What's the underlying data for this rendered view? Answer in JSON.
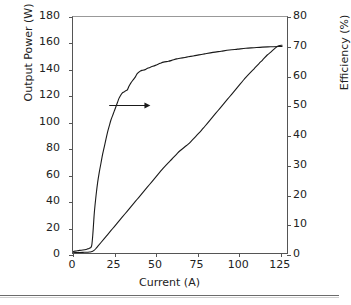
{
  "chart_data": {
    "type": "line",
    "title": "",
    "xlabel": "Current (A)",
    "ylabel": "Output Power (W)",
    "y2label": "Efficiency (%)",
    "xlim": [
      0,
      130
    ],
    "ylim": [
      0,
      180
    ],
    "y2lim": [
      0,
      80
    ],
    "grid": false,
    "legend": "none",
    "xticks": [
      "0",
      "25",
      "50",
      "75",
      "100",
      "125"
    ],
    "xtick_values": [
      0,
      25,
      50,
      75,
      100,
      125
    ],
    "yticks": [
      "0",
      "20",
      "40",
      "60",
      "80",
      "100",
      "120",
      "140",
      "160",
      "180"
    ],
    "ytick_values": [
      0,
      20,
      40,
      60,
      80,
      100,
      120,
      140,
      160,
      180
    ],
    "y2ticks": [
      "0",
      "10",
      "20",
      "30",
      "40",
      "50",
      "60",
      "70",
      "80"
    ],
    "y2tick_values": [
      0,
      10,
      20,
      30,
      40,
      50,
      60,
      70,
      80
    ],
    "annotations": [
      {
        "name": "arrow-to-right-axis",
        "type": "arrow",
        "direction": "right",
        "x_start": 22,
        "x_end": 47,
        "y_axis": "right",
        "y_value": 50
      }
    ],
    "series": [
      {
        "name": "Output Power",
        "axis": "left",
        "units": "W",
        "color": "#1a1a1a",
        "x": [
          0,
          2,
          4,
          6,
          8,
          10,
          11,
          12,
          13,
          14,
          15,
          17,
          20,
          23,
          25,
          28,
          30,
          33,
          35,
          38,
          40,
          43,
          45,
          48,
          50,
          53,
          55,
          58,
          60,
          63,
          65,
          68,
          70,
          72,
          75,
          78,
          80,
          83,
          85,
          88,
          90,
          93,
          95,
          98,
          100,
          103,
          105,
          108,
          110,
          113,
          115,
          118,
          120,
          123,
          125,
          127
        ],
        "y": [
          0.2,
          0.3,
          0.4,
          0.5,
          0.6,
          0.8,
          1.0,
          1.4,
          2.2,
          3.5,
          5.0,
          8.0,
          12.5,
          17.0,
          20.0,
          24.5,
          27.5,
          32.0,
          35.0,
          39.5,
          42.5,
          47.0,
          50.0,
          54.5,
          57.5,
          62.0,
          65.0,
          69.0,
          71.5,
          75.5,
          78.0,
          81.0,
          83.0,
          85.5,
          89.5,
          93.5,
          96.5,
          101.0,
          104.0,
          108.5,
          111.5,
          116.0,
          119.0,
          123.5,
          126.5,
          131.0,
          134.0,
          138.0,
          140.5,
          144.5,
          147.0,
          151.0,
          153.0,
          156.5,
          158.0,
          158.5
        ]
      },
      {
        "name": "Efficiency",
        "axis": "right",
        "units": "%",
        "color": "#1a1a1a",
        "x": [
          0,
          2,
          4,
          6,
          8,
          9,
          10,
          11,
          11.5,
          12,
          12.5,
          13,
          14,
          15,
          16,
          17,
          18,
          19,
          20,
          21,
          22,
          23,
          24,
          25,
          26,
          27,
          28,
          29,
          30,
          31,
          32,
          33,
          34,
          35,
          36,
          37,
          38,
          39,
          40,
          41,
          42,
          43,
          45,
          47,
          50,
          53,
          55,
          58,
          60,
          63,
          65,
          68,
          70,
          73,
          75,
          78,
          80,
          85,
          90,
          95,
          100,
          105,
          110,
          115,
          120,
          125,
          127
        ],
        "y": [
          0.5,
          0.7,
          0.9,
          1.0,
          1.2,
          1.4,
          1.6,
          2.0,
          3.0,
          6.0,
          10.0,
          14.0,
          19.5,
          24.0,
          27.5,
          30.5,
          33.5,
          36.0,
          38.5,
          41.0,
          43.0,
          45.0,
          46.5,
          48.0,
          49.5,
          51.0,
          52.5,
          53.5,
          54.3,
          54.6,
          55.0,
          55.3,
          56.5,
          57.5,
          58.3,
          59.0,
          59.8,
          60.8,
          61.3,
          61.7,
          61.9,
          62.0,
          62.5,
          63.0,
          63.6,
          64.3,
          64.7,
          65.0,
          65.3,
          65.8,
          66.0,
          66.3,
          66.5,
          66.8,
          67.0,
          67.3,
          67.5,
          68.0,
          68.4,
          68.8,
          69.1,
          69.4,
          69.6,
          69.8,
          69.9,
          70.0,
          70.0
        ]
      }
    ]
  }
}
